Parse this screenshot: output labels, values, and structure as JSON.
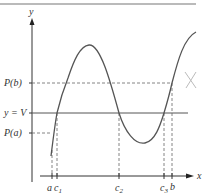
{
  "diagram": {
    "type": "intermediate-value-theorem",
    "axes": {
      "x_label": "x",
      "y_label": "y"
    },
    "y_levels": {
      "pb_label": "P(b)",
      "v_label": "y = V",
      "pa_label": "P(a)"
    },
    "x_ticks": {
      "a": "a",
      "c1": "c",
      "c1_sub": "1",
      "c2": "c",
      "c2_sub": "2",
      "c3": "c",
      "c3_sub": "3",
      "b": "b"
    },
    "annotation_mark": "X",
    "colors": {
      "curve": "#555555",
      "axes": "#333333",
      "dashed": "#666666",
      "mark": "#bbbbbb"
    }
  }
}
